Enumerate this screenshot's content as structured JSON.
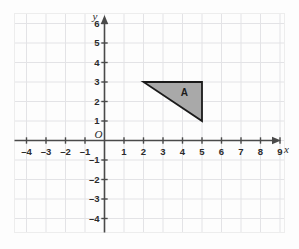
{
  "chart_data": {
    "type": "scatter",
    "title": "",
    "xlabel": "x",
    "ylabel": "y",
    "grid": true,
    "legend": "none",
    "xlim": [
      -4.6,
      9.3
    ],
    "ylim": [
      -4.6,
      6.5
    ],
    "origin_label": "O",
    "x_ticks": [
      -4,
      -3,
      -2,
      -1,
      1,
      2,
      3,
      4,
      5,
      6,
      7,
      8,
      9
    ],
    "y_ticks": [
      6,
      5,
      4,
      3,
      2,
      1,
      -1,
      -2,
      -3,
      -4
    ],
    "x_tick_labels": [
      "–4",
      "–3",
      "–2",
      "–1",
      "1",
      "2",
      "3",
      "4",
      "5",
      "6",
      "7",
      "8",
      "9"
    ],
    "y_tick_labels": [
      "6",
      "5",
      "4",
      "3",
      "2",
      "1",
      "–1",
      "–2",
      "–3",
      "–4"
    ],
    "shapes": [
      {
        "name": "A",
        "label": "A",
        "type": "triangle",
        "vertices": [
          [
            2,
            3
          ],
          [
            5,
            3
          ],
          [
            5,
            1
          ]
        ],
        "label_at": [
          4.1,
          2.45
        ],
        "fill": "#a9a9a9",
        "stroke": "#1a1a1a"
      }
    ],
    "colors": {
      "grid_line": "#e3e3e6",
      "axis_line": "#4a4a4a",
      "background": "#fdfdfd",
      "border": "#ededed",
      "text": "#2b2b2b"
    }
  }
}
